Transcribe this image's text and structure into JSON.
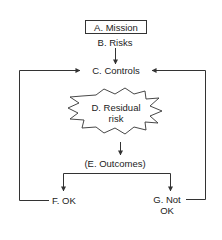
{
  "diagram": {
    "type": "flowchart",
    "nodes": {
      "mission": "A. Mission",
      "risks": "B. Risks",
      "controls": "C. Controls",
      "residual_line1": "D. Residual",
      "residual_line2": "risk",
      "outcomes": "(E. Outcomes)",
      "ok": "F. OK",
      "not_ok_line1": "G. Not",
      "not_ok_line2": "OK"
    },
    "edges": [
      {
        "from": "B. Risks",
        "to": "C. Controls"
      },
      {
        "from": "D. Residual risk",
        "to": "(E. Outcomes)"
      },
      {
        "from": "(E. Outcomes)",
        "to": "F. OK"
      },
      {
        "from": "(E. Outcomes)",
        "to": "G. Not OK"
      },
      {
        "from": "F. OK",
        "to": "C. Controls"
      },
      {
        "from": "G. Not OK",
        "to": "C. Controls"
      }
    ],
    "colors": {
      "stroke": "#333333",
      "text": "#222222",
      "background": "#ffffff"
    }
  }
}
